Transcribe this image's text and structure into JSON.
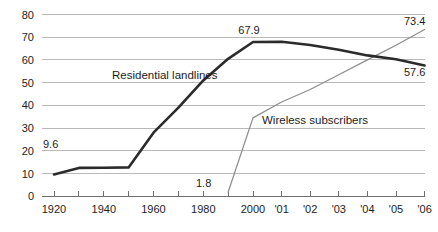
{
  "chart_data": {
    "type": "line",
    "title": "",
    "subtitle": "",
    "xlabel": "",
    "ylabel": "",
    "ylim": [
      0,
      80
    ],
    "y_ticks": [
      0,
      10,
      20,
      30,
      40,
      50,
      60,
      70,
      80
    ],
    "y_tick_labels": [
      "0",
      "10",
      "20",
      "30",
      "40",
      "50",
      "60",
      "70",
      "80"
    ],
    "x_categories": [
      "1920",
      "1930",
      "1940",
      "1950",
      "1960",
      "1970",
      "1980",
      "1990",
      "2000",
      "'01",
      "'02",
      "'03",
      "'04",
      "'05",
      "'06"
    ],
    "x_tick_labels_shown": [
      "1920",
      "1940",
      "1960",
      "1980",
      "2000",
      "'01",
      "'02",
      "'03",
      "'04",
      "'05",
      "'06"
    ],
    "grid": true,
    "legend_position": "inline-annotation",
    "series": [
      {
        "name": "Residential landlines",
        "color": "#2b2b2b",
        "x": [
          "1920",
          "1930",
          "1940",
          "1950",
          "1960",
          "1970",
          "1980",
          "1990",
          "2000",
          "'01",
          "'02",
          "'03",
          "'04",
          "'05",
          "'06"
        ],
        "values": [
          9.6,
          12.5,
          12.6,
          12.7,
          28.0,
          39.0,
          51.0,
          60.5,
          67.9,
          68.0,
          66.6,
          64.5,
          62.0,
          60.3,
          57.6
        ],
        "endpoint_labels": [
          {
            "label": "9.6",
            "at": "1920",
            "value": 9.6
          },
          {
            "label": "67.9",
            "at": "2000",
            "value": 67.9
          },
          {
            "label": "57.6",
            "at": "'06",
            "value": 57.6
          }
        ]
      },
      {
        "name": "Wireless subscribers",
        "color": "#8d8d8d",
        "x": [
          "1990",
          "2000",
          "'01",
          "'02",
          "'03",
          "'04",
          "'05",
          "'06"
        ],
        "values": [
          1.8,
          34.5,
          41.5,
          47.0,
          53.5,
          60.0,
          66.5,
          73.4
        ],
        "endpoint_labels": [
          {
            "label": "1.8",
            "at": "1990",
            "value": 1.8
          },
          {
            "label": "73.4",
            "at": "'06",
            "value": 73.4
          }
        ]
      }
    ],
    "annotations": [
      {
        "name": "series-label-landlines",
        "text": "Residential landlines"
      },
      {
        "name": "series-label-wireless",
        "text": "Wireless subscribers"
      }
    ]
  },
  "labels": {
    "y_axis": [
      "0",
      "10",
      "20",
      "30",
      "40",
      "50",
      "60",
      "70",
      "80"
    ],
    "x_axis": [
      "1920",
      "1940",
      "1960",
      "1980",
      "2000",
      "'01",
      "'02",
      "'03",
      "'04",
      "'05",
      "'06"
    ],
    "value_9_6": "9.6",
    "value_67_9": "67.9",
    "value_57_6": "57.6",
    "value_1_8": "1.8",
    "value_73_4": "73.4",
    "series_landlines": "Residential landlines",
    "series_wireless": "Wireless subscribers"
  },
  "colors": {
    "landlines": "#2b2b2b",
    "wireless": "#8d8d8d",
    "gridline": "#b9b9b9",
    "axis": "#6f6f6f",
    "text": "#1c1c1c",
    "background": "#ffffff"
  }
}
